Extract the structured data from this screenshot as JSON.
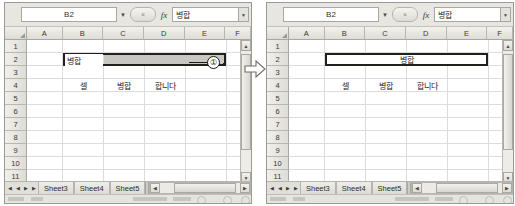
{
  "app": {
    "name_box_value": "B2",
    "formula_bar_value": "병합",
    "fx_label": "fx",
    "name_box_caret_icon": "chevron-down-icon",
    "formula_expand_icon": "chevron-down-icon",
    "cancel_icon": "x-icon"
  },
  "grid": {
    "column_headers": [
      "A",
      "B",
      "C",
      "D",
      "E",
      "F"
    ],
    "row_headers": [
      "1",
      "2",
      "3",
      "4",
      "5",
      "6",
      "7",
      "8",
      "9",
      "10",
      "11"
    ]
  },
  "left_panel": {
    "selection_label": "B2:D2",
    "cells": {
      "b2": "병합",
      "b4": "셀",
      "c4": "병합",
      "d4": "합니다"
    }
  },
  "right_panel": {
    "merged_label": "B2:D2",
    "cells": {
      "merged_b2_d2": "병합",
      "b4": "셀",
      "c4": "병합",
      "d4": "합니다"
    }
  },
  "tabs": {
    "nav_first_icon": "first-sheet-icon",
    "nav_prev_icon": "prev-sheet-icon",
    "nav_next_icon": "next-sheet-icon",
    "nav_last_icon": "last-sheet-icon",
    "nav_first": "◀",
    "nav_prev": "◀",
    "nav_next": "▶",
    "nav_last": "▶",
    "sheets": [
      "Sheet3",
      "Sheet4",
      "Sheet5"
    ],
    "hscroll_left": "◀",
    "hscroll_right": "▶"
  },
  "scrollbar": {
    "up_arrow": "▲",
    "down_arrow": "▼"
  },
  "annotations": {
    "callout_1": "①",
    "transition_arrow_icon": "right-arrow-icon"
  },
  "colors": {
    "grid_line": "#dcdcdc",
    "selection_border": "#22201c",
    "selection_shade": "#c9c7c2",
    "header_bg": "#e4e2dc",
    "window_chrome": "#eceae4"
  }
}
